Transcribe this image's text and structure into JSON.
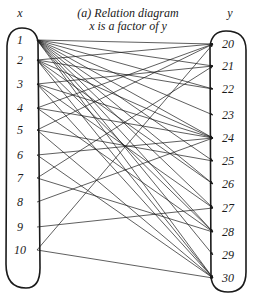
{
  "title": {
    "caption_top_cut": "",
    "line1": "(a) Relation diagram",
    "line2": "x is a factor of y"
  },
  "axes": {
    "left_label": "x",
    "right_label": "y"
  },
  "domain_set": [
    "1",
    "2",
    "3",
    "4",
    "5",
    "6",
    "7",
    "8",
    "9",
    "10"
  ],
  "codomain_set": [
    "20",
    "21",
    "22",
    "23",
    "24",
    "25",
    "26",
    "27",
    "28",
    "29",
    "30"
  ],
  "relation": "x is a factor of y",
  "colors": {
    "ink": "#1a1a1a",
    "background": "#ffffff"
  },
  "chart_data": {
    "type": "relation_diagram",
    "left_set_label": "x",
    "right_set_label": "y",
    "left_set": [
      1,
      2,
      3,
      4,
      5,
      6,
      7,
      8,
      9,
      10
    ],
    "right_set": [
      20,
      21,
      22,
      23,
      24,
      25,
      26,
      27,
      28,
      29,
      30
    ],
    "edges": [
      [
        1,
        20
      ],
      [
        1,
        21
      ],
      [
        1,
        22
      ],
      [
        1,
        23
      ],
      [
        1,
        24
      ],
      [
        1,
        25
      ],
      [
        1,
        26
      ],
      [
        1,
        27
      ],
      [
        1,
        28
      ],
      [
        1,
        29
      ],
      [
        1,
        30
      ],
      [
        2,
        20
      ],
      [
        2,
        22
      ],
      [
        2,
        24
      ],
      [
        2,
        26
      ],
      [
        2,
        28
      ],
      [
        2,
        30
      ],
      [
        3,
        21
      ],
      [
        3,
        24
      ],
      [
        3,
        27
      ],
      [
        3,
        30
      ],
      [
        4,
        20
      ],
      [
        4,
        24
      ],
      [
        4,
        28
      ],
      [
        5,
        20
      ],
      [
        5,
        25
      ],
      [
        5,
        30
      ],
      [
        6,
        24
      ],
      [
        6,
        30
      ],
      [
        7,
        21
      ],
      [
        7,
        28
      ],
      [
        8,
        24
      ],
      [
        9,
        27
      ],
      [
        10,
        20
      ],
      [
        10,
        30
      ]
    ]
  }
}
